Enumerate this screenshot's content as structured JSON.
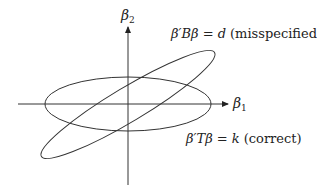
{
  "diagram": {
    "axes": {
      "x_label": "β",
      "x_subscript": "1",
      "y_label": "β",
      "y_subscript": "2"
    },
    "ellipses": [
      {
        "name": "misspecified",
        "label_math": "β′Bβ = d",
        "label_note": "(misspecified)",
        "orientation": "tilted"
      },
      {
        "name": "correct",
        "label_math": "β′Tβ = k",
        "label_note": "(correct)",
        "orientation": "horizontal"
      }
    ],
    "colors": {
      "stroke": "#333333",
      "background": "#ffffff"
    }
  }
}
